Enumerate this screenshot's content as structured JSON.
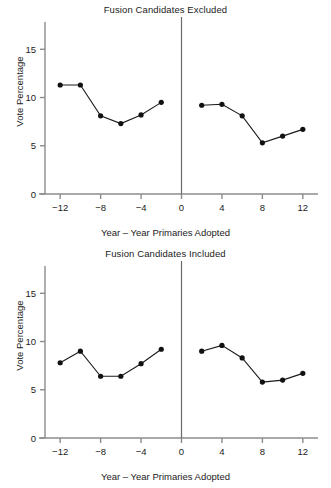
{
  "figure": {
    "xlabel": "Year – Year Primaries Adopted",
    "ylabel": "Vote Percentage"
  },
  "axis": {
    "y_ticks": [
      "0",
      "5",
      "10",
      "15"
    ],
    "x_ticks": [
      "−12",
      "−8",
      "−4",
      "0",
      "4",
      "8",
      "12"
    ]
  },
  "panels": {
    "top": {
      "title": "Fusion Candidates Excluded"
    },
    "bottom": {
      "title": "Fusion Candidates Included"
    }
  },
  "chart_data": [
    {
      "type": "line",
      "title": "Fusion Candidates Excluded",
      "xlabel": "Year – Year Primaries Adopted",
      "ylabel": "Vote Percentage",
      "xlim": [
        -13.5,
        13.5
      ],
      "ylim": [
        0,
        17
      ],
      "yticks": [
        0,
        5,
        10,
        15
      ],
      "xticks": [
        -12,
        -8,
        -4,
        0,
        4,
        8,
        12
      ],
      "grid": false,
      "legend": "none",
      "annotations": [
        "vertical reference line at x = 0"
      ],
      "series": [
        {
          "name": "Before primaries adopted",
          "x": [
            -12,
            -10,
            -8,
            -6,
            -4,
            -2
          ],
          "values": [
            11.3,
            11.3,
            8.1,
            7.3,
            8.2,
            9.5
          ]
        },
        {
          "name": "After primaries adopted",
          "x": [
            2,
            4,
            6,
            8,
            10,
            12
          ],
          "values": [
            9.2,
            9.3,
            8.1,
            5.3,
            6.0,
            6.7
          ]
        }
      ]
    },
    {
      "type": "line",
      "title": "Fusion Candidates Included",
      "xlabel": "Year – Year Primaries Adopted",
      "ylabel": "Vote Percentage",
      "xlim": [
        -13.5,
        13.5
      ],
      "ylim": [
        0,
        17
      ],
      "yticks": [
        0,
        5,
        10,
        15
      ],
      "xticks": [
        -12,
        -8,
        -4,
        0,
        4,
        8,
        12
      ],
      "grid": false,
      "legend": "none",
      "annotations": [
        "vertical reference line at x = 0"
      ],
      "series": [
        {
          "name": "Before primaries adopted",
          "x": [
            -12,
            -10,
            -8,
            -6,
            -4,
            -2
          ],
          "values": [
            7.8,
            9.0,
            6.4,
            6.4,
            7.7,
            9.2
          ]
        },
        {
          "name": "After primaries adopted",
          "x": [
            2,
            4,
            6,
            8,
            10,
            12
          ],
          "values": [
            9.0,
            9.6,
            8.3,
            5.8,
            6.0,
            6.7
          ]
        }
      ]
    }
  ]
}
